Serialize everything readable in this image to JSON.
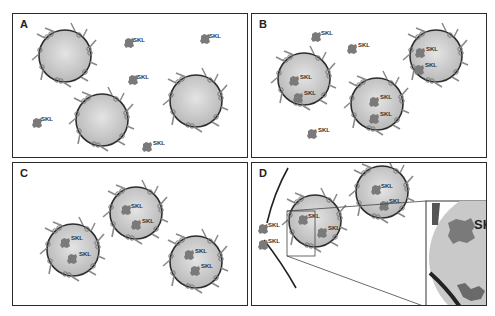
{
  "figure": {
    "panels": [
      {
        "id": "A",
        "label": "A",
        "description": "Peroxisomes with membrane proteins; SKL cargo free in cytosol"
      },
      {
        "id": "B",
        "label": "B",
        "description": "Some SKL cargo imported into peroxisomes, some remains in cytosol"
      },
      {
        "id": "C",
        "label": "C",
        "description": "All SKL cargo imported into peroxisomes"
      },
      {
        "id": "D",
        "label": "D",
        "description": "Peroxisome engulfed by membrane; inset zoom of boxed region"
      }
    ],
    "cargo_label": "SKL",
    "inset_label": "SK",
    "colors": {
      "border": "#2a2a2a",
      "peroxisome_fill": "#c8c8c8",
      "peroxisome_edge": "#333333",
      "cargo": "#7a7a7a",
      "membrane_protein": "#8a8a8a"
    }
  }
}
